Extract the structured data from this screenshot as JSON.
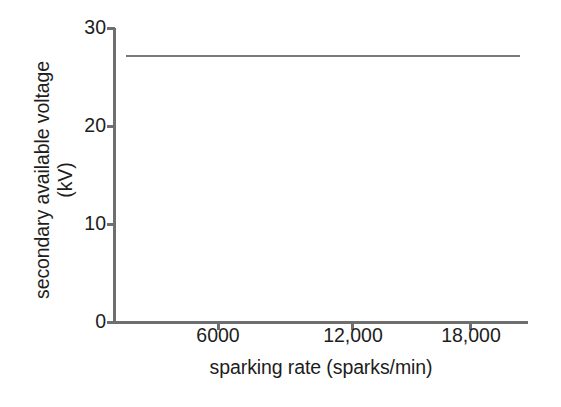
{
  "chart_data": {
    "type": "line",
    "title": "",
    "xlabel": "sparking rate (sparks/min)",
    "ylabel_line1": "secondary available voltage",
    "ylabel_line2": "(kV)",
    "ylabel": "secondary available voltage (kV)",
    "xlim": [
      0,
      21000
    ],
    "ylim": [
      0,
      30
    ],
    "xticks": [
      6000,
      12000,
      18000
    ],
    "xticklabels": [
      "6000",
      "12,000",
      "18,000"
    ],
    "yticks": [
      0,
      10,
      20,
      30
    ],
    "yticklabels": [
      "0",
      "10",
      "20",
      "30"
    ],
    "grid": false,
    "legend": false,
    "legend_position": "none",
    "series": [
      {
        "name": "secondary available voltage",
        "x": [
          600,
          6000,
          12000,
          18000,
          20600
        ],
        "values": [
          27.2,
          27.2,
          27.2,
          27.2,
          27.2
        ],
        "color": "#7a7a7a"
      }
    ],
    "annotations": [],
    "axis_color": "#6f6f6f",
    "text_color": "#1d1d1d",
    "background": "#ffffff"
  },
  "axes": {
    "y_title_line1": "secondary available voltage",
    "y_title_line2": "(kV)",
    "x_title": "sparking rate (sparks/min)"
  }
}
